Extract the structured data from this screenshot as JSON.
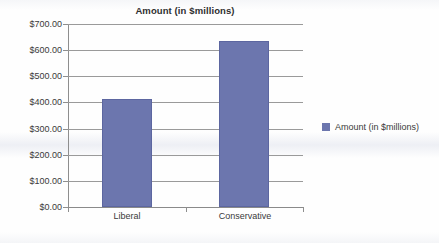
{
  "chart_data": {
    "type": "bar",
    "title": "Amount (in $millions)",
    "xlabel": "",
    "ylabel": "",
    "categories": [
      "Liberal",
      "Conservative"
    ],
    "values": [
      415,
      635
    ],
    "series": [
      {
        "name": "Amount (in $millions)",
        "values": [
          415,
          635
        ]
      }
    ],
    "ylim": [
      0,
      700
    ],
    "ytick_values": [
      0,
      100,
      200,
      300,
      400,
      500,
      600,
      700
    ],
    "ytick_labels": [
      "$0.00",
      "$100.00",
      "$200.00",
      "$300.00",
      "$400.00",
      "$500.00",
      "$600.00",
      "$700.00"
    ],
    "grid": true,
    "legend_position": "right",
    "legend_entries": [
      "Amount (in $millions)"
    ],
    "bar_color": "#6c76ae",
    "gridline_color": "#9a9a9a",
    "axis_color": "#8e8e8e",
    "background_color": "#fefefe",
    "text_color": "#3a3a3a"
  }
}
